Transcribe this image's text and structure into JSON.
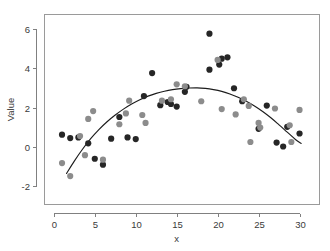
{
  "chart_data": {
    "type": "scatter",
    "title": "",
    "xlabel": "x",
    "ylabel": "Value",
    "xlim": [
      -1.2,
      32.5
    ],
    "ylim": [
      -2.95,
      6.75
    ],
    "xticks": [
      0,
      5,
      10,
      15,
      20,
      25,
      30
    ],
    "yticks": [
      -2,
      0,
      2,
      4,
      6
    ],
    "xticklabels": [
      "0",
      "5",
      "10",
      "15",
      "20",
      "25",
      "30"
    ],
    "yticklabels": [
      "-2",
      "0",
      "2",
      "4",
      "6"
    ],
    "grid": false,
    "legend": null,
    "marker": "filled-circle",
    "colors": {
      "dark_points": "#262626",
      "light_points": "#8c8c8c",
      "curve": "#1c1c1c",
      "axis": "#808080",
      "frame": "#9a9a9a",
      "background": "#ffffff"
    },
    "series": [
      {
        "name": "dark",
        "color": "#262626",
        "points": [
          [
            1.0,
            0.62
          ],
          [
            2.0,
            0.45
          ],
          [
            3.0,
            0.48
          ],
          [
            4.2,
            0.18
          ],
          [
            5.0,
            -0.6
          ],
          [
            6.0,
            -0.9
          ],
          [
            7.0,
            0.42
          ],
          [
            8.0,
            1.52
          ],
          [
            9.0,
            0.48
          ],
          [
            10.0,
            0.4
          ],
          [
            11.0,
            2.58
          ],
          [
            12.0,
            3.75
          ],
          [
            13.0,
            2.12
          ],
          [
            13.9,
            2.28
          ],
          [
            14.3,
            2.18
          ],
          [
            15.0,
            2.05
          ],
          [
            16.0,
            2.8
          ],
          [
            16.2,
            3.05
          ],
          [
            19.0,
            5.75
          ],
          [
            19.0,
            3.92
          ],
          [
            20.2,
            4.18
          ],
          [
            20.5,
            4.48
          ],
          [
            21.2,
            4.55
          ],
          [
            22.0,
            2.98
          ],
          [
            23.0,
            2.32
          ],
          [
            25.0,
            0.92
          ],
          [
            26.0,
            2.1
          ],
          [
            27.2,
            0.22
          ],
          [
            28.0,
            0.02
          ],
          [
            28.5,
            1.02
          ],
          [
            30.0,
            0.68
          ]
        ]
      },
      {
        "name": "light",
        "color": "#8c8c8c",
        "points": [
          [
            1.0,
            -0.82
          ],
          [
            2.0,
            -1.48
          ],
          [
            3.2,
            0.55
          ],
          [
            3.8,
            -0.42
          ],
          [
            4.2,
            1.42
          ],
          [
            4.8,
            1.82
          ],
          [
            6.0,
            -0.65
          ],
          [
            8.0,
            1.15
          ],
          [
            8.8,
            1.7
          ],
          [
            9.2,
            2.35
          ],
          [
            10.8,
            1.62
          ],
          [
            11.2,
            1.22
          ],
          [
            13.2,
            2.35
          ],
          [
            14.3,
            2.42
          ],
          [
            15.0,
            3.18
          ],
          [
            16.0,
            3.08
          ],
          [
            18.0,
            2.32
          ],
          [
            20.0,
            4.42
          ],
          [
            20.5,
            1.92
          ],
          [
            22.2,
            1.65
          ],
          [
            23.2,
            2.42
          ],
          [
            23.8,
            2.08
          ],
          [
            24.0,
            0.25
          ],
          [
            25.0,
            1.22
          ],
          [
            25.2,
            0.98
          ],
          [
            27.0,
            1.95
          ],
          [
            28.8,
            1.1
          ],
          [
            29.0,
            0.25
          ],
          [
            30.0,
            1.88
          ]
        ]
      }
    ],
    "fit_curve": {
      "name": "quadratic-fit",
      "color": "#1c1c1c",
      "points": [
        [
          1.55,
          -1.35
        ],
        [
          2.5,
          -0.72
        ],
        [
          3.5,
          -0.12
        ],
        [
          4.5,
          0.42
        ],
        [
          5.5,
          0.88
        ],
        [
          6.5,
          1.28
        ],
        [
          7.5,
          1.62
        ],
        [
          8.5,
          1.92
        ],
        [
          9.5,
          2.18
        ],
        [
          10.5,
          2.4
        ],
        [
          11.5,
          2.58
        ],
        [
          12.5,
          2.72
        ],
        [
          13.5,
          2.83
        ],
        [
          14.5,
          2.91
        ],
        [
          15.5,
          2.96
        ],
        [
          16.5,
          2.99
        ],
        [
          17.5,
          3.0
        ],
        [
          18.5,
          2.97
        ],
        [
          19.5,
          2.91
        ],
        [
          20.5,
          2.82
        ],
        [
          21.5,
          2.69
        ],
        [
          22.5,
          2.52
        ],
        [
          23.5,
          2.32
        ],
        [
          24.5,
          2.08
        ],
        [
          25.5,
          1.8
        ],
        [
          26.5,
          1.48
        ],
        [
          27.5,
          1.12
        ],
        [
          28.5,
          0.75
        ],
        [
          29.5,
          0.38
        ],
        [
          30.2,
          0.18
        ]
      ]
    }
  }
}
